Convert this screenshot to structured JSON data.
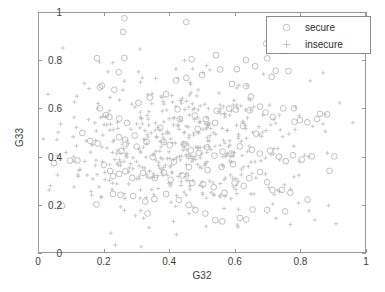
{
  "chart_data": {
    "type": "scatter",
    "title": "",
    "xlabel": "G32",
    "ylabel": "G33",
    "xlim": [
      0,
      1
    ],
    "ylim": [
      0,
      1
    ],
    "xticks": [
      "0",
      "0.2",
      "0.4",
      "0.6",
      "0.8",
      "1"
    ],
    "yticks": [
      "0",
      "0.2",
      "0.4",
      "0.6",
      "0.8",
      "1"
    ],
    "xtick_values": [
      0,
      0.2,
      0.4,
      0.6,
      0.8,
      1
    ],
    "ytick_values": [
      0,
      0.2,
      0.4,
      0.6,
      0.8,
      1
    ],
    "grid": false,
    "legend_position": "top-right",
    "marker_color": "#b4b4b4",
    "axis_color": "#9a9a9a",
    "text_color": "#3d3d3d",
    "series": [
      {
        "name": "secure",
        "marker": "circle",
        "color": "#b4b4b4",
        "points": [
          [
            0.262,
            0.978
          ],
          [
            0.452,
            0.962
          ],
          [
            0.258,
            0.921
          ],
          [
            0.178,
            0.811
          ],
          [
            0.262,
            0.812
          ],
          [
            0.468,
            0.806
          ],
          [
            0.543,
            0.824
          ],
          [
            0.697,
            0.872
          ],
          [
            0.635,
            0.803
          ],
          [
            0.7,
            0.81
          ],
          [
            0.245,
            0.752
          ],
          [
            0.556,
            0.764
          ],
          [
            0.607,
            0.765
          ],
          [
            0.663,
            0.777
          ],
          [
            0.726,
            0.758
          ],
          [
            0.765,
            0.757
          ],
          [
            0.193,
            0.696
          ],
          [
            0.187,
            0.689
          ],
          [
            0.231,
            0.679
          ],
          [
            0.592,
            0.703
          ],
          [
            0.636,
            0.694
          ],
          [
            0.65,
            0.651
          ],
          [
            0.42,
            0.718
          ],
          [
            0.452,
            0.728
          ],
          [
            0.5,
            0.74
          ],
          [
            0.39,
            0.66
          ],
          [
            0.34,
            0.646
          ],
          [
            0.305,
            0.624
          ],
          [
            0.186,
            0.601
          ],
          [
            0.205,
            0.573
          ],
          [
            0.216,
            0.565
          ],
          [
            0.246,
            0.558
          ],
          [
            0.27,
            0.54
          ],
          [
            0.425,
            0.597
          ],
          [
            0.478,
            0.571
          ],
          [
            0.512,
            0.556
          ],
          [
            0.545,
            0.591
          ],
          [
            0.583,
            0.6
          ],
          [
            0.604,
            0.596
          ],
          [
            0.646,
            0.593
          ],
          [
            0.678,
            0.608
          ],
          [
            0.695,
            0.584
          ],
          [
            0.717,
            0.565
          ],
          [
            0.749,
            0.601
          ],
          [
            0.784,
            0.545
          ],
          [
            0.8,
            0.552
          ],
          [
            0.823,
            0.543
          ],
          [
            0.853,
            0.557
          ],
          [
            0.862,
            0.578
          ],
          [
            0.133,
            0.498
          ],
          [
            0.157,
            0.465
          ],
          [
            0.18,
            0.454
          ],
          [
            0.246,
            0.48
          ],
          [
            0.264,
            0.47
          ],
          [
            0.294,
            0.487
          ],
          [
            0.33,
            0.46
          ],
          [
            0.383,
            0.46
          ],
          [
            0.401,
            0.447
          ],
          [
            0.444,
            0.452
          ],
          [
            0.466,
            0.425
          ],
          [
            0.49,
            0.414
          ],
          [
            0.516,
            0.438
          ],
          [
            0.538,
            0.403
          ],
          [
            0.563,
            0.42
          ],
          [
            0.59,
            0.412
          ],
          [
            0.616,
            0.442
          ],
          [
            0.653,
            0.428
          ],
          [
            0.677,
            0.412
          ],
          [
            0.709,
            0.424
          ],
          [
            0.736,
            0.399
          ],
          [
            0.757,
            0.38
          ],
          [
            0.779,
            0.405
          ],
          [
            0.806,
            0.387
          ],
          [
            0.837,
            0.4
          ],
          [
            0.046,
            0.372
          ],
          [
            0.095,
            0.382
          ],
          [
            0.118,
            0.383
          ],
          [
            0.199,
            0.364
          ],
          [
            0.218,
            0.339
          ],
          [
            0.227,
            0.318
          ],
          [
            0.246,
            0.327
          ],
          [
            0.265,
            0.338
          ],
          [
            0.286,
            0.31
          ],
          [
            0.319,
            0.331
          ],
          [
            0.355,
            0.309
          ],
          [
            0.383,
            0.332
          ],
          [
            0.404,
            0.302
          ],
          [
            0.44,
            0.32
          ],
          [
            0.47,
            0.289
          ],
          [
            0.504,
            0.283
          ],
          [
            0.536,
            0.271
          ],
          [
            0.569,
            0.247
          ],
          [
            0.6,
            0.29
          ],
          [
            0.628,
            0.277
          ],
          [
            0.645,
            0.309
          ],
          [
            0.678,
            0.334
          ],
          [
            0.7,
            0.292
          ],
          [
            0.716,
            0.259
          ],
          [
            0.745,
            0.26
          ],
          [
            0.771,
            0.247
          ],
          [
            0.227,
            0.243
          ],
          [
            0.25,
            0.239
          ],
          [
            0.289,
            0.234
          ],
          [
            0.326,
            0.211
          ],
          [
            0.354,
            0.221
          ],
          [
            0.39,
            0.243
          ],
          [
            0.429,
            0.218
          ],
          [
            0.459,
            0.197
          ],
          [
            0.48,
            0.175
          ],
          [
            0.51,
            0.161
          ],
          [
            0.541,
            0.133
          ],
          [
            0.562,
            0.128
          ],
          [
            0.616,
            0.143
          ],
          [
            0.636,
            0.136
          ],
          [
            0.071,
            0.193
          ],
          [
            0.176,
            0.199
          ],
          [
            0.333,
            0.161
          ],
          [
            0.655,
            0.178
          ],
          [
            0.7,
            0.176
          ],
          [
            0.755,
            0.17
          ],
          [
            0.824,
            0.219
          ],
          [
            0.891,
            0.339
          ],
          [
            0.906,
            0.4
          ],
          [
            0.884,
            0.576
          ],
          [
            0.782,
            0.601
          ],
          [
            0.714,
            0.733
          ],
          [
            0.54,
            0.54
          ],
          [
            0.487,
            0.515
          ],
          [
            0.432,
            0.556
          ],
          [
            0.372,
            0.52
          ],
          [
            0.626,
            0.527
          ],
          [
            0.666,
            0.495
          ],
          [
            0.3,
            0.441
          ],
          [
            0.253,
            0.423
          ],
          [
            0.56,
            0.356
          ],
          [
            0.595,
            0.367
          ],
          [
            0.517,
            0.343
          ],
          [
            0.46,
            0.355
          ],
          [
            0.414,
            0.378
          ],
          [
            0.349,
            0.397
          ]
        ]
      },
      {
        "name": "insecure",
        "marker": "plus",
        "color": "#bdbdbd",
        "density": "high",
        "count_approx": 520
      }
    ]
  },
  "legend": {
    "entries": [
      {
        "label": "secure",
        "marker": "circle"
      },
      {
        "label": "insecure",
        "marker": "plus"
      }
    ]
  },
  "axes": {
    "x": {
      "label": "G32",
      "ticklabels": [
        "0",
        "0.2",
        "0.4",
        "0.6",
        "0.8",
        "1"
      ]
    },
    "y": {
      "label": "G33",
      "ticklabels": [
        "0",
        "0.2",
        "0.4",
        "0.6",
        "0.8",
        "1"
      ]
    }
  }
}
